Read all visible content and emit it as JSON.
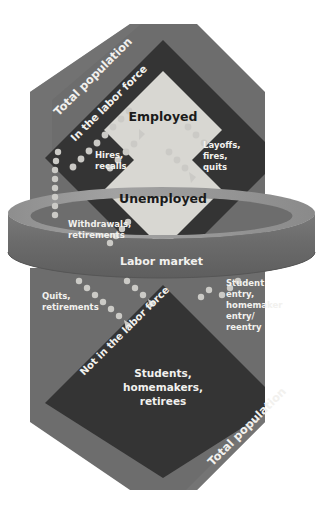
{
  "diagram": {
    "type": "flow-diagram",
    "palette": {
      "background": "#ffffff",
      "outer_region": "#6d6d6d",
      "outer_region_light": "#7c7c7c",
      "inner_region": "#343434",
      "state_box": "#d8d7d2",
      "cylinder_top": "#9a9a9a",
      "cylinder_side": "#6b6b6b",
      "label_light": "#f2f1ee",
      "label_dark": "#1b1b1b",
      "dot": "#c9c8c4"
    },
    "regions": {
      "upper_population": {
        "label": "Total population",
        "name": "upper-total-population"
      },
      "in_labor_force": {
        "label": "In the labor force",
        "name": "in-the-labor-force"
      },
      "labor_market": {
        "label": "Labor market",
        "name": "labor-market-cylinder"
      },
      "not_in_labor_force": {
        "label": "Not in the labor force",
        "name": "not-in-the-labor-force"
      },
      "lower_population": {
        "label": "Total population",
        "name": "lower-total-population"
      }
    },
    "states": [
      {
        "id": "employed",
        "label": "Employed"
      },
      {
        "id": "unemployed",
        "label": "Unemployed"
      },
      {
        "id": "not-in-labor-force",
        "label_lines": [
          "Students,",
          "homemakers,",
          "retirees"
        ]
      }
    ],
    "flows": [
      {
        "id": "hires-recalls",
        "label_lines": [
          "Hires,",
          "recalls"
        ],
        "direction": "unemployed-to-employed"
      },
      {
        "id": "layoffs-fires-quits",
        "label_lines": [
          "Layoffs,",
          "fires,",
          "quits"
        ],
        "direction": "employed-to-unemployed"
      },
      {
        "id": "withdrawals-retirements",
        "label_lines": [
          "Withdrawals,",
          "retirements"
        ],
        "direction": "labor-force-to-not-in-labor-force"
      },
      {
        "id": "quits-retirements",
        "label_lines": [
          "Quits,",
          "retirements"
        ],
        "direction": "labor-market-to-not-in-labor-force"
      },
      {
        "id": "student-homemaker-entry",
        "label_lines": [
          "Student",
          "entry,",
          "homemaker",
          "entry/",
          "reentry"
        ],
        "direction": "not-in-labor-force-to-labor-market"
      }
    ]
  }
}
